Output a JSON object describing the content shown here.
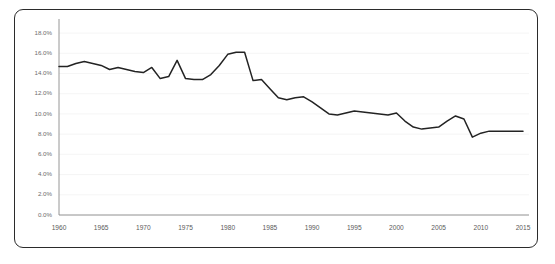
{
  "card": {
    "border_color": "#2b2b2b",
    "background": "#ffffff"
  },
  "chart_data": {
    "type": "line",
    "title": "",
    "subtitle": "",
    "xlabel": "",
    "ylabel": "",
    "xlim": [
      1960,
      2015
    ],
    "ylim": [
      0.0,
      19.0
    ],
    "grid": true,
    "legend": null,
    "legend_position": "none",
    "line_color": "#232323",
    "grid_color": "#f0f0f0",
    "axis_color": "#8a8a8a",
    "y_tick_labels": [
      "18.0%",
      "16.0%",
      "14.0%",
      "12.0%",
      "10.0%",
      "8.0%",
      "6.0%",
      "4.0%",
      "2.0%",
      "0.0%"
    ],
    "y_tick_values": [
      18.0,
      16.0,
      14.0,
      12.0,
      10.0,
      8.0,
      6.0,
      4.0,
      2.0,
      0.0
    ],
    "x_tick_labels": [
      "1960",
      "1965",
      "1970",
      "1975",
      "1980",
      "1985",
      "1990",
      "1995",
      "2000",
      "2005",
      "2010",
      "2015"
    ],
    "x_tick_values": [
      1960,
      1965,
      1970,
      1975,
      1980,
      1985,
      1990,
      1995,
      2000,
      2005,
      2010,
      2015
    ],
    "series": [
      {
        "name": "",
        "x": [
          1960,
          1961,
          1962,
          1963,
          1964,
          1965,
          1966,
          1967,
          1968,
          1969,
          1970,
          1971,
          1972,
          1973,
          1974,
          1975,
          1976,
          1977,
          1978,
          1979,
          1980,
          1981,
          1982,
          1983,
          1984,
          1985,
          1986,
          1987,
          1988,
          1989,
          1990,
          1991,
          1992,
          1993,
          1994,
          1995,
          1996,
          1997,
          1998,
          1999,
          2000,
          2001,
          2002,
          2003,
          2004,
          2005,
          2006,
          2007,
          2008,
          2009,
          2010,
          2011,
          2012,
          2013,
          2014,
          2015
        ],
        "values": [
          14.7,
          14.7,
          15.0,
          15.2,
          15.0,
          14.8,
          14.4,
          14.6,
          14.4,
          14.2,
          14.1,
          14.6,
          13.5,
          13.7,
          15.3,
          13.5,
          13.4,
          13.4,
          13.9,
          14.8,
          15.9,
          16.1,
          16.1,
          13.3,
          13.4,
          12.5,
          11.6,
          11.4,
          11.6,
          11.7,
          11.2,
          10.6,
          10.0,
          9.9,
          10.1,
          10.3,
          10.2,
          10.1,
          10.0,
          9.9,
          10.1,
          9.3,
          8.7,
          8.5,
          8.6,
          8.7,
          9.3,
          9.8,
          9.5,
          7.7,
          8.1,
          8.3,
          8.3,
          8.3,
          8.3,
          8.3
        ]
      }
    ]
  }
}
